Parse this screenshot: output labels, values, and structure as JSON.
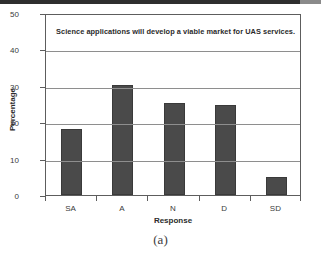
{
  "figure": {
    "caption": "(a)"
  },
  "chart_data": {
    "type": "bar",
    "title": "Science applications will develop a viable market for UAS services.",
    "categories": [
      "SA",
      "A",
      "N",
      "D",
      "SD"
    ],
    "values": [
      18.0,
      30.3,
      25.3,
      24.6,
      5.0
    ],
    "xlabel": "Response",
    "ylabel": "Percentage",
    "ylim": [
      0,
      50
    ],
    "yticks": [
      0,
      10,
      20,
      30,
      40,
      50
    ],
    "ytick_labels": [
      "0",
      "10",
      "20",
      "30",
      "40",
      "50"
    ],
    "grid": true,
    "grid_axis": "y",
    "legend": null,
    "bar_color": "#4a4a4a",
    "frame_color": "#5d5d5d",
    "background": "#ffffff"
  }
}
